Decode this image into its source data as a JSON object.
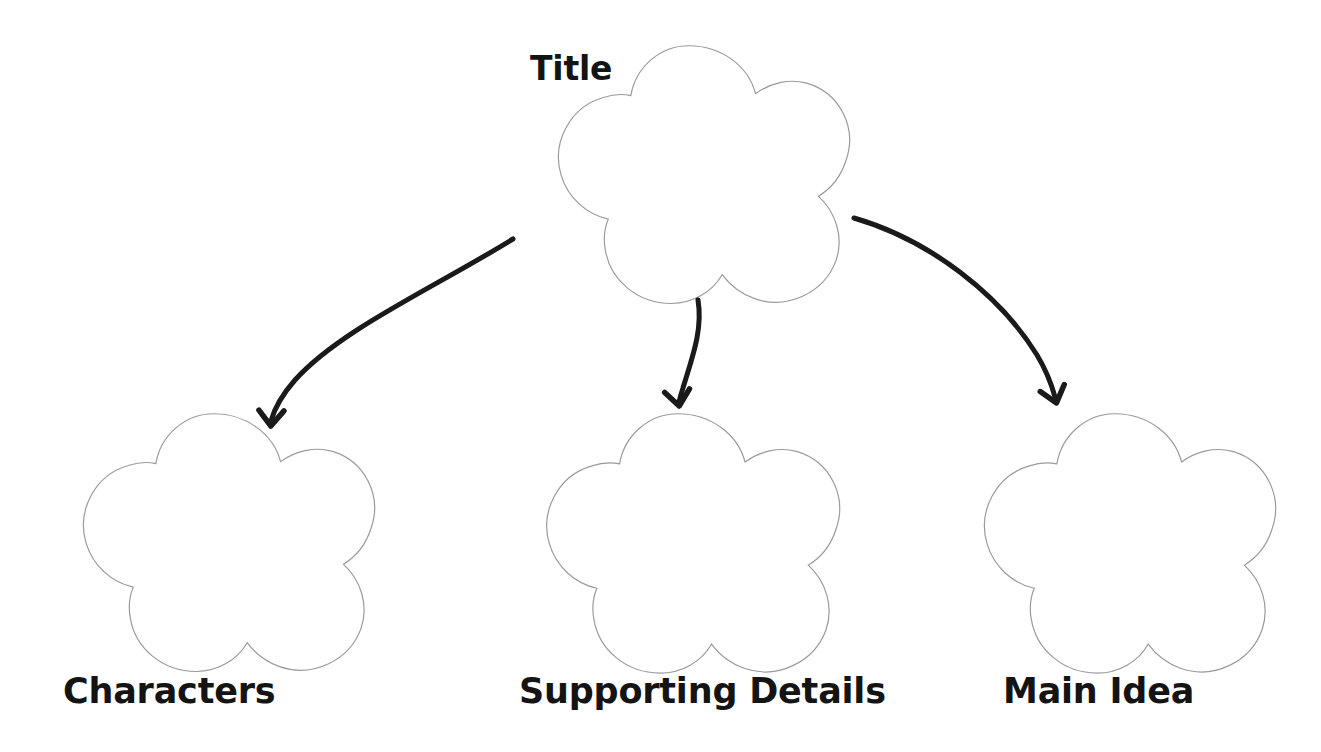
{
  "page": {
    "background_color": "#ffffff",
    "width": 1321,
    "height": 752
  },
  "style": {
    "shape_outline_color": "#9a9a9a",
    "shape_fill_color": "#ffffff",
    "shape_outline_width": 1.2,
    "arrow_color": "#1a1a1a",
    "arrow_width": 5,
    "label_color": "#141414"
  },
  "diagram": {
    "type": "hierarchy",
    "shape_kind": "five-lobed-cloud",
    "root": {
      "id": "title",
      "label": "Title",
      "label_position": "top-left-outside",
      "center": {
        "x": 690,
        "y": 175
      },
      "radius": 175
    },
    "children": [
      {
        "id": "characters",
        "label": "Characters",
        "label_position": "below",
        "center": {
          "x": 215,
          "y": 543
        },
        "radius": 175
      },
      {
        "id": "supporting-details",
        "label": "Supporting Details",
        "label_position": "below",
        "center": {
          "x": 678,
          "y": 544
        },
        "radius": 176
      },
      {
        "id": "main-idea",
        "label": "Main Idea",
        "label_position": "below",
        "center": {
          "x": 1115,
          "y": 544
        },
        "radius": 175
      }
    ],
    "connectors": [
      {
        "id": "arrow-title-to-characters",
        "from": "title",
        "to": "characters",
        "direction": "down-left",
        "curved": true
      },
      {
        "id": "arrow-title-to-supporting-details",
        "from": "title",
        "to": "supporting-details",
        "direction": "down",
        "curved": true
      },
      {
        "id": "arrow-title-to-main-idea",
        "from": "title",
        "to": "main-idea",
        "direction": "down-right",
        "curved": true
      }
    ]
  }
}
